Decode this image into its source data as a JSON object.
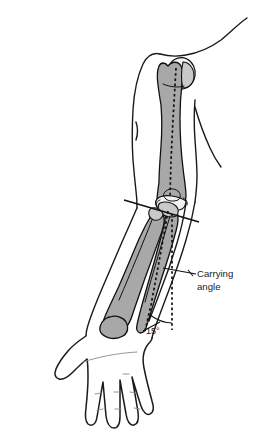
{
  "figure": {
    "background_color": "#ffffff"
  },
  "annotations": {
    "carrying_angle": {
      "label_line_1": "Carrying",
      "label_line_2": "angle",
      "leader_name": "carrying-angle-leader"
    },
    "angle_value": {
      "text": "15°",
      "degrees": 15
    }
  },
  "anatomy": {
    "bones": [
      {
        "name": "humerus",
        "label": "humerus"
      },
      {
        "name": "humeral-head",
        "label": "humeral head"
      },
      {
        "name": "radius",
        "label": "radius"
      },
      {
        "name": "ulna",
        "label": "ulna"
      },
      {
        "name": "olecranon",
        "label": "olecranon"
      }
    ],
    "soft_tissue": [
      {
        "name": "shoulder-contour",
        "label": "shoulder"
      },
      {
        "name": "upper-arm-outline",
        "label": "upper arm"
      },
      {
        "name": "forearm-outline",
        "label": "forearm"
      },
      {
        "name": "hand-outline",
        "label": "hand"
      }
    ]
  },
  "construction_lines": {
    "humeral_axis": "dotted long axis of humerus",
    "forearm_axis": "dotted long axis of forearm",
    "epicondylar_line": "transverse line through elbow",
    "reference_vertical": "dotted vertical reference"
  },
  "colors": {
    "bone_fill": "#a8a8a8",
    "bone_light": "#f2f2f2",
    "outline": "#1a1a1a",
    "crease": "#8a8a8a",
    "background": "#ffffff"
  }
}
